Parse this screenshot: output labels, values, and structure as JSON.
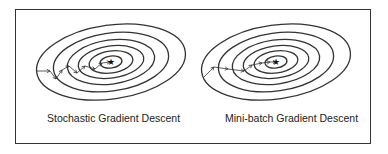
{
  "panels": [
    {
      "title": "Stochastic Gradient Descent",
      "center": [
        111,
        62
      ],
      "contours": [
        [
          75,
          37
        ],
        [
          58,
          29
        ],
        [
          44,
          22
        ],
        [
          33,
          16
        ],
        [
          22,
          11
        ],
        [
          11,
          6
        ]
      ],
      "path": [
        [
          37,
          71
        ],
        [
          50,
          71
        ],
        [
          56,
          79
        ],
        [
          62,
          70
        ],
        [
          69,
          66
        ],
        [
          77,
          73
        ],
        [
          85,
          66
        ],
        [
          95,
          69
        ],
        [
          102,
          63
        ],
        [
          110,
          62
        ]
      ]
    },
    {
      "title": "Mini-batch Gradient Descent",
      "center": [
        276,
        62
      ],
      "contours": [
        [
          75,
          37
        ],
        [
          58,
          29
        ],
        [
          44,
          22
        ],
        [
          33,
          16
        ],
        [
          22,
          11
        ],
        [
          11,
          6
        ]
      ],
      "path": [
        [
          203,
          78
        ],
        [
          214,
          67
        ],
        [
          228,
          69
        ],
        [
          244,
          71
        ],
        [
          252,
          65
        ],
        [
          262,
          63
        ],
        [
          270,
          62
        ],
        [
          276,
          62
        ]
      ]
    }
  ],
  "colors": {
    "stroke": "#333333",
    "frame": "#333333"
  }
}
